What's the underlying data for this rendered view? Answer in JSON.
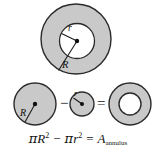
{
  "figure": {
    "colors": {
      "fill_gray": "#c9c9c9",
      "stroke": "#2b2b2b",
      "inner_white": "#ffffff",
      "text": "#121212",
      "background": "#ffffff"
    },
    "top_diagram": {
      "name": "annulus-with-radii",
      "outer_label": "R",
      "inner_label": "r",
      "center_dot": true,
      "outer_circle": {
        "cx": 76,
        "cy": 39,
        "r": 35
      },
      "inner_circle": {
        "cx": 77,
        "cy": 41,
        "r": 17
      },
      "inner_radius_line": {
        "x1": 77,
        "y1": 41,
        "x2": 62,
        "y2": 33
      },
      "outer_radius_line": {
        "x1": 77,
        "y1": 41,
        "x2": 59,
        "y2": 70
      }
    },
    "equation_row": {
      "name": "circle-subtraction-row",
      "minus_sign": "−",
      "equals_sign": "=",
      "big_circle": {
        "label": "R",
        "cx": 35,
        "cy": 104,
        "r": 21,
        "radius_line": {
          "x1": 35,
          "y1": 104,
          "x2": 25,
          "y2": 122
        }
      },
      "small_circle": {
        "label": "r",
        "cx": 82,
        "cy": 104,
        "r": 12,
        "radius_line": {
          "x1": 82,
          "y1": 104,
          "x2": 73,
          "y2": 98
        }
      },
      "result_annulus": {
        "cx": 130,
        "cy": 104,
        "outer_r": 21,
        "inner_r": 11
      }
    },
    "formula": {
      "name": "annulus-area-formula",
      "full_text": "πR² − πr² = A_annulus",
      "pi1": "π",
      "var_R": "R",
      "exp_R": "2",
      "minus": "−",
      "pi2": "π",
      "var_r": "r",
      "exp_r": "2",
      "equals": "=",
      "var_A": "A",
      "sub_A": "annulus"
    }
  }
}
